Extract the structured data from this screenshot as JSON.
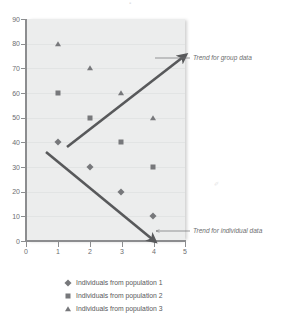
{
  "chart_data": {
    "type": "scatter",
    "title": "",
    "subtitle": "",
    "xlabel": "",
    "ylabel": "",
    "xlim": [
      0,
      5
    ],
    "ylim": [
      0,
      90
    ],
    "xticks": [
      "0",
      "1",
      "2",
      "3",
      "4",
      "5"
    ],
    "yticks": [
      "0",
      "10",
      "20",
      "30",
      "40",
      "50",
      "60",
      "70",
      "80",
      "90"
    ],
    "grid": "horizontal",
    "legend_position": "bottom",
    "marker_color": "#77787b",
    "arrow_color": "#58595b",
    "plot_background": "#eceded",
    "series": [
      {
        "name": "Individuals from population 1",
        "marker": "diamond",
        "x": [
          1,
          2,
          3,
          4
        ],
        "values": [
          40,
          30,
          20,
          10
        ]
      },
      {
        "name": "Individuals from population 2",
        "marker": "square",
        "x": [
          1,
          2,
          3,
          4
        ],
        "values": [
          60,
          50,
          40,
          30
        ]
      },
      {
        "name": "Individuals from population 3",
        "marker": "triangle",
        "x": [
          1,
          2,
          3,
          4
        ],
        "values": [
          80,
          70,
          60,
          50
        ]
      }
    ],
    "annotations": [
      {
        "label": "Trend for group data",
        "direction": "up",
        "from": [
          1.2,
          36
        ],
        "to": [
          4.95,
          73
        ]
      },
      {
        "label": "Trend for individual data",
        "direction": "down",
        "from": [
          0.62,
          35
        ],
        "to": [
          4.05,
          1
        ]
      }
    ]
  },
  "axes": {
    "y_tick_labels": [
      "90",
      "80",
      "70",
      "60",
      "50",
      "40",
      "30",
      "20",
      "10",
      "0"
    ],
    "x_tick_labels": [
      "0",
      "1",
      "2",
      "3",
      "4",
      "5"
    ]
  },
  "annotations": {
    "group_trend_label": "Trend for group data",
    "individual_trend_label": "Trend for individual data"
  },
  "legend": {
    "items": [
      {
        "marker": "diamond",
        "label": "Individuals from population 1"
      },
      {
        "marker": "square",
        "label": "Individuals from population 2"
      },
      {
        "marker": "triangle",
        "label": "Individuals from population 3"
      }
    ]
  }
}
